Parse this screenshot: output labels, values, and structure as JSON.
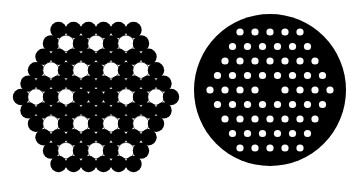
{
  "diagram": {
    "background": "#ffffff",
    "fill_color": "#000000",
    "hole_color": "#ffffff",
    "hexagonal_bundle": {
      "center": [
        96,
        97
      ],
      "pitch_x": 15,
      "pitch_y": 13.4,
      "radius": 8.2,
      "row_counts": [
        6,
        7,
        8,
        9,
        10,
        11,
        10,
        9,
        8,
        7,
        6
      ],
      "white_positions": {
        "1": [
          1,
          3,
          5
        ],
        "3": [
          1,
          3,
          5,
          7
        ],
        "5": [
          1,
          3,
          7,
          9
        ],
        "7": [
          1,
          3,
          5,
          7
        ],
        "9": [
          1,
          3,
          5
        ]
      }
    },
    "perforated_disc": {
      "center": [
        270,
        90
      ],
      "radius": 76,
      "hole_pitch_x": 15,
      "hole_pitch_y": 14.5,
      "hole_radius": 3.6,
      "row_counts": [
        5,
        6,
        7,
        8,
        9,
        8,
        7,
        6,
        5
      ],
      "missing": {
        "4": [
          4
        ]
      }
    }
  }
}
